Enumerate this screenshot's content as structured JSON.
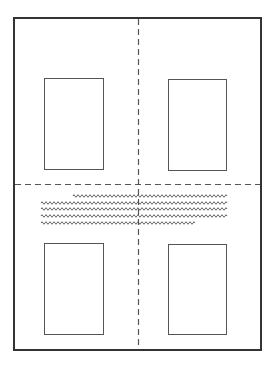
{
  "diagram": {
    "title": "",
    "canvas": {
      "width": 277,
      "height": 371
    },
    "colors": {
      "background": "#ffffff",
      "frame": "#333333",
      "boxes": "#555555",
      "fold_lines": "#555555",
      "text_lines": "#555555"
    },
    "page_frame": {
      "x": 14,
      "y": 18,
      "width": 247,
      "height": 332,
      "stroke_width": 2
    },
    "fold_lines": {
      "vertical": {
        "x": 138,
        "y1": 19,
        "y2": 349,
        "dash": "6,4"
      },
      "horizontal": {
        "y": 184,
        "x1": 15,
        "x2": 260,
        "dash": "6,4"
      }
    },
    "boxes": [
      {
        "id": "top-left",
        "x": 44,
        "y": 78,
        "width": 59,
        "height": 91
      },
      {
        "id": "top-right",
        "x": 168,
        "y": 79,
        "width": 58,
        "height": 91
      },
      {
        "id": "bottom-left",
        "x": 44,
        "y": 243,
        "width": 59,
        "height": 91
      },
      {
        "id": "bottom-right",
        "x": 168,
        "y": 244,
        "width": 58,
        "height": 90
      }
    ],
    "text_lines": [
      {
        "x1": 73,
        "x2": 227,
        "y": 196
      },
      {
        "x1": 41,
        "x2": 227,
        "y": 203
      },
      {
        "x1": 41,
        "x2": 227,
        "y": 209
      },
      {
        "x1": 41,
        "x2": 227,
        "y": 216
      },
      {
        "x1": 41,
        "x2": 196,
        "y": 223
      }
    ],
    "wave": {
      "period": 4,
      "amplitude": 1.3
    }
  }
}
